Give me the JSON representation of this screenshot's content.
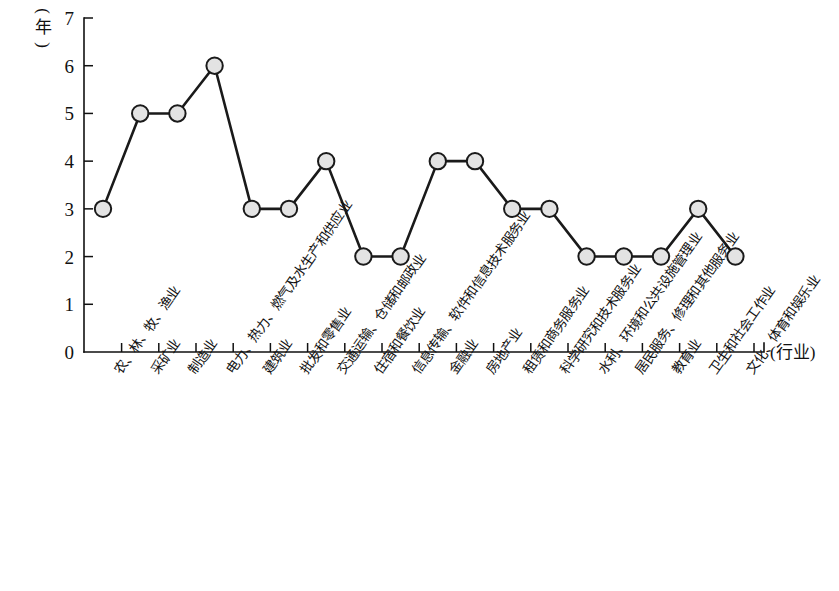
{
  "chart_data": {
    "type": "line",
    "title": "",
    "xlabel": "(行业)",
    "ylabel": "(年)",
    "ylim": [
      0,
      7
    ],
    "yticks": [
      "0",
      "1",
      "2",
      "3",
      "4",
      "5",
      "6",
      "7"
    ],
    "grid": false,
    "legend": "none",
    "marker": "circle",
    "categories": [
      "农、林、牧、渔业",
      "采矿业",
      "制造业",
      "电力、热力、燃气及水生产和供应业",
      "建筑业",
      "批发和零售业",
      "交通运输、仓储和邮政业",
      "住宿和餐饮业",
      "信息传输、软件和信息技术服务业",
      "金融业",
      "房地产业",
      "租赁和商务服务业",
      "科学研究和技术服务业",
      "水利、环境和公共设施管理业",
      "居民服务、修理和其他服务业",
      "教育业",
      "卫生和社会工作业",
      "文化、体育和娱乐业"
    ],
    "values": [
      3,
      5,
      5,
      6,
      3,
      3,
      4,
      2,
      2,
      4,
      4,
      3,
      3,
      2,
      2,
      2,
      3,
      2
    ]
  },
  "colors": {
    "axis": "#111111",
    "line": "#1a1a1a",
    "marker_fill": "#e3e3e3",
    "marker_stroke": "#1a1a1a",
    "background": "#ffffff"
  },
  "ylabel_parts": {
    "open": "(",
    "text": "年",
    "close": ")"
  }
}
